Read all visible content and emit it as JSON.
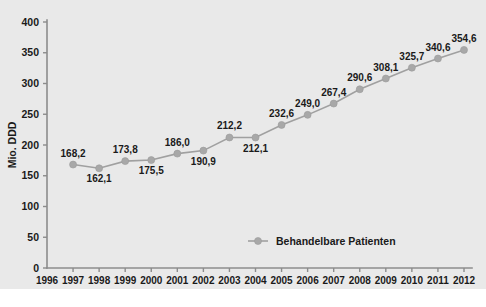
{
  "chart_data": {
    "type": "line",
    "title": "",
    "subtitle": "",
    "xlabel": "",
    "ylabel": "Mio. DDD",
    "grid": false,
    "legend_position": "bottom-center",
    "ylim": [
      0,
      400
    ],
    "ytick_labels": [
      "0",
      "50",
      "100",
      "150",
      "200",
      "250",
      "300",
      "350",
      "400"
    ],
    "ytick_values": [
      0,
      50,
      100,
      150,
      200,
      250,
      300,
      350,
      400
    ],
    "categories": [
      "1996",
      "1997",
      "1998",
      "1999",
      "2000",
      "2001",
      "2002",
      "2003",
      "2004",
      "2005",
      "2006",
      "2007",
      "2008",
      "2009",
      "2010",
      "2011",
      "2012"
    ],
    "series": [
      {
        "name": "Behandelbare Patienten",
        "color": "#a8a8a8",
        "x": [
          "1997",
          "1998",
          "1999",
          "2000",
          "2001",
          "2002",
          "2003",
          "2004",
          "2005",
          "2006",
          "2007",
          "2008",
          "2009",
          "2010",
          "2011",
          "2012"
        ],
        "values": [
          168.2,
          162.1,
          173.8,
          175.5,
          186.0,
          190.9,
          212.2,
          212.1,
          232.6,
          249.0,
          267.4,
          290.6,
          308.1,
          325.7,
          340.6,
          354.6
        ],
        "data_labels": [
          "168,2",
          "162,1",
          "173,8",
          "175,5",
          "186,0",
          "190,9",
          "212,2",
          "212,1",
          "232,6",
          "249,0",
          "267,4",
          "290,6",
          "308,1",
          "325,7",
          "340,6",
          "354,6"
        ],
        "label_placement": [
          "above",
          "below",
          "above",
          "below",
          "above",
          "below",
          "above",
          "below",
          "above",
          "above",
          "above",
          "above",
          "above",
          "above",
          "above",
          "above"
        ]
      }
    ],
    "legend": [
      {
        "label": "Behandelbare Patienten",
        "color": "#a8a8a8",
        "marker": "circle"
      }
    ]
  },
  "colors": {
    "panel_background": "#e9e9e9",
    "page_background": "#ffffff",
    "axis": "#8c8c8c",
    "series": "#a8a8a8",
    "text": "#1a1a1a"
  }
}
